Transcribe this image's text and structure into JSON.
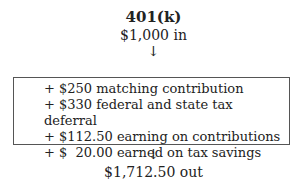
{
  "title": "401(k)",
  "input": "$1,000 in",
  "arrow": "↓",
  "items": [
    "+ $250 matching contribution",
    "+ $330 federal and state tax deferral",
    "+ $112.50 earning on contributions",
    "+ $  20.00 earned on tax savings"
  ],
  "output": "$1,712.50 out"
}
